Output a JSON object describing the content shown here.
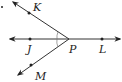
{
  "diagram": {
    "type": "geometry-rays",
    "vertex": {
      "label": "P",
      "x": 69,
      "y": 39
    },
    "points": [
      {
        "label": "K",
        "x": 29,
        "y": 13,
        "label_x": 33,
        "label_y": 11
      },
      {
        "label": "J",
        "x": 30,
        "y": 39,
        "label_x": 27,
        "label_y": 53
      },
      {
        "label": "L",
        "x": 102,
        "y": 39,
        "label_x": 99,
        "label_y": 53
      },
      {
        "label": "M",
        "x": 31,
        "y": 65,
        "label_x": 35,
        "label_y": 80
      }
    ],
    "vertex_label": {
      "text": "P",
      "x": 69,
      "y": 53
    },
    "stroke_color": "#333333"
  }
}
